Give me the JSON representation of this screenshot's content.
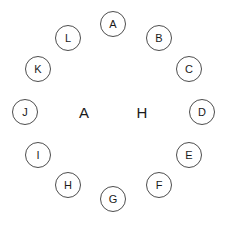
{
  "canvas": {
    "width": 229,
    "height": 226,
    "background_color": "#ffffff"
  },
  "style": {
    "node_stroke_color": "#4d4d4d",
    "node_stroke_width": 1,
    "node_fill_color": "#ffffff",
    "node_diameter": 26,
    "node_label_color": "#1a1a1a",
    "node_label_font_size": 11,
    "center_label_color": "#1a1a1a",
    "center_label_font_size": 15
  },
  "diagram": {
    "type": "circular-node-layout",
    "layout": {
      "center_x": 113,
      "center_y": 112,
      "radius": 89,
      "node_count": 12,
      "start_angle_deg": -90,
      "step_angle_deg": 30
    },
    "nodes": [
      {
        "label": "A",
        "angle_deg": -90,
        "cx": 113,
        "cy": 24,
        "clock_position": 12
      },
      {
        "label": "B",
        "angle_deg": -60,
        "cx": 159,
        "cy": 38,
        "clock_position": 1
      },
      {
        "label": "C",
        "angle_deg": -30,
        "cx": 189,
        "cy": 69,
        "clock_position": 2
      },
      {
        "label": "D",
        "angle_deg": 0,
        "cx": 202,
        "cy": 112,
        "clock_position": 3
      },
      {
        "label": "E",
        "angle_deg": 30,
        "cx": 189,
        "cy": 155,
        "clock_position": 4
      },
      {
        "label": "F",
        "angle_deg": 60,
        "cx": 159,
        "cy": 185,
        "clock_position": 5
      },
      {
        "label": "G",
        "angle_deg": 90,
        "cx": 113,
        "cy": 199,
        "clock_position": 6
      },
      {
        "label": "H",
        "angle_deg": 120,
        "cx": 68,
        "cy": 185,
        "clock_position": 7
      },
      {
        "label": "I",
        "angle_deg": 150,
        "cx": 38,
        "cy": 155,
        "clock_position": 8
      },
      {
        "label": "J",
        "angle_deg": 180,
        "cx": 25,
        "cy": 112,
        "clock_position": 9
      },
      {
        "label": "K",
        "angle_deg": 210,
        "cx": 38,
        "cy": 69,
        "clock_position": 10
      },
      {
        "label": "L",
        "angle_deg": 240,
        "cx": 68,
        "cy": 38,
        "clock_position": 11
      }
    ],
    "center_labels": [
      {
        "text": "A",
        "x": 84,
        "y": 112
      },
      {
        "text": "H",
        "x": 142,
        "y": 112
      }
    ]
  }
}
